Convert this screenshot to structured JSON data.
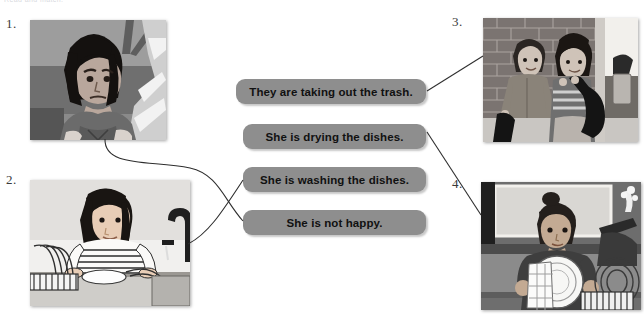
{
  "worksheet": {
    "instruction": "Read and match.",
    "bubble_color": "#8e8e8e",
    "line_color": "#2e2e2e",
    "background": "#ffffff"
  },
  "panels": [
    {
      "number": "1.",
      "alt": "Grayscale illustration of a girl with dark bobbed hair frowning, looking unhappy while seated indoors",
      "matches_bubble": 4
    },
    {
      "number": "2.",
      "alt": "Grayscale illustration of a girl in a striped shirt washing dishes at a kitchen sink with a dish rack and faucet",
      "matches_bubble": 3
    },
    {
      "number": "3.",
      "alt": "Grayscale illustration of a man and a boy carrying black trash bags in front of a brick wall",
      "matches_bubble": 1
    },
    {
      "number": "4.",
      "alt": "Grayscale illustration of a person drying a white plate with a towel beside a dish rack",
      "matches_bubble": 2
    }
  ],
  "bubbles": [
    {
      "id": 1,
      "text": "They are taking out the trash."
    },
    {
      "id": 2,
      "text": "She is drying the dishes."
    },
    {
      "id": 3,
      "text": "She is washing the dishes."
    },
    {
      "id": 4,
      "text": "She is not happy."
    }
  ]
}
